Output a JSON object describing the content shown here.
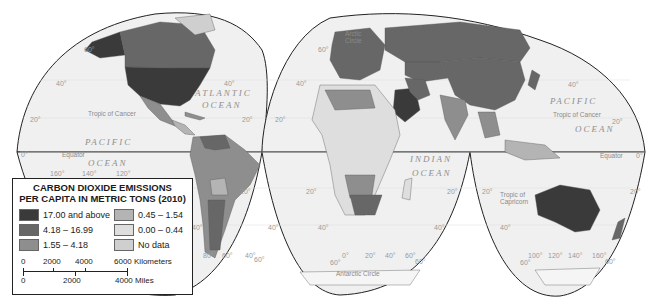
{
  "legend": {
    "title_line1": "CARBON DIOXIDE EMISSIONS",
    "title_line2": "PER CAPITA IN METRIC TONS (2010)",
    "items": [
      {
        "label": "17.00 and above",
        "color": "#3a3a3a"
      },
      {
        "label": "0.45 – 1.54",
        "color": "#b4b4b4"
      },
      {
        "label": "4.18 – 16.99",
        "color": "#676767"
      },
      {
        "label": "0.00 – 0.44",
        "color": "#dedede"
      },
      {
        "label": "1.55 – 4.18",
        "color": "#8e8e8e"
      },
      {
        "label": "No data",
        "color": "#cfcfcf"
      }
    ],
    "scale": {
      "km_ticks": [
        "0",
        "2000",
        "4000",
        "6000 Kilometers"
      ],
      "mile_ticks": [
        "0",
        "2000",
        "4000 Miles"
      ]
    }
  },
  "map": {
    "ocean_labels": {
      "atlantic_1": "ATLANTIC",
      "atlantic_2": "OCEAN",
      "pacific_w_1": "PACIFIC",
      "pacific_w_2": "OCEAN",
      "pacific_e_1": "PACIFIC",
      "pacific_e_2": "OCEAN",
      "indian_1": "INDIAN",
      "indian_2": "OCEAN"
    },
    "lines": {
      "arctic_1": "Arctic",
      "arctic_2": "Circle",
      "tropic_cancer_w": "Tropic of Cancer",
      "tropic_cancer_e": "Tropic of Cancer",
      "equator_w": "Equator",
      "equator_e": "Equator",
      "tropic_capricorn_1": "Tropic of",
      "tropic_capricorn_2": "Capricorn",
      "antarctic": "Antarctic Circle"
    },
    "lat_labels": {
      "n60_w": "60°",
      "n40_w": "40°",
      "n20_w": "20°",
      "eq_w": "0°",
      "n40_mid": "40°",
      "n20_mid": "20°",
      "n60_e": "60°",
      "n40_e": "40°",
      "n20_e": "20°",
      "n40_far": "40°",
      "n20_far": "20°",
      "eq_far": "0°",
      "s20_a": "20°",
      "s20_b": "20°",
      "s40_a": "40°",
      "s40_b": "40°",
      "s60_a": "60°",
      "s60_b": "60°",
      "s20_c": "20°",
      "s20_d": "20°",
      "s40_c": "40°",
      "s40_d": "40°",
      "s60_c": "60°",
      "s60_d": "60°",
      "s20_e": "20°",
      "s40_e": "40°",
      "s60_e": "60°"
    },
    "lon_labels": {
      "w160": "160°",
      "w140": "140°",
      "w120": "120°",
      "w80": "80°",
      "w60": "60°",
      "w40": "40°",
      "e0": "0°",
      "e20": "20°",
      "e40": "40°",
      "e60": "60°",
      "e100": "100°",
      "e120": "120°",
      "e140": "140°",
      "e160": "160°"
    }
  }
}
